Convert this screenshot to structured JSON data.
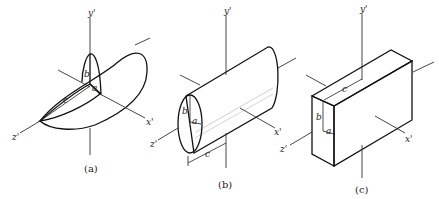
{
  "figure": {
    "panels": [
      {
        "id": "a",
        "caption": "(a)",
        "shape": "ellipsoid",
        "axes": {
          "x": "x'",
          "y": "y'",
          "z": "z'"
        },
        "dimensions": {
          "a": "a",
          "b": "b",
          "c": "c"
        }
      },
      {
        "id": "b",
        "caption": "(b)",
        "shape": "elliptic cylinder",
        "axes": {
          "x": "x'",
          "y": "y'",
          "z": "z'"
        },
        "dimensions": {
          "a": "a",
          "b": "b",
          "c": "c"
        }
      },
      {
        "id": "c",
        "caption": "(c)",
        "shape": "rectangular block",
        "axes": {
          "x": "x'",
          "y": "y'",
          "z": "z'"
        },
        "dimensions": {
          "a": "a",
          "b": "b",
          "c": "c"
        }
      }
    ],
    "colors": {
      "line": "#111111",
      "shade_light": "#e6e6e6",
      "shade_dark": "#b8b8b8",
      "background": "#ffffff"
    }
  }
}
